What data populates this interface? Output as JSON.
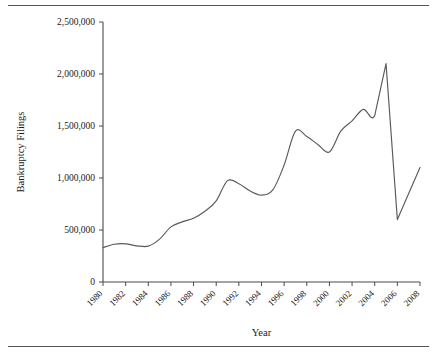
{
  "chart_data": {
    "type": "line",
    "title": "",
    "xlabel": "Year",
    "ylabel": "Bankruptcy Filings",
    "grid": false,
    "legend": "none",
    "xlim": [
      1980,
      2008
    ],
    "ylim": [
      0,
      2500000
    ],
    "x_tick_labels": [
      "1980",
      "1982",
      "1984",
      "1986",
      "1988",
      "1990",
      "1992",
      "1994",
      "1996",
      "1998",
      "2000",
      "2002",
      "2004",
      "2006",
      "2008"
    ],
    "x_tick_values": [
      1980,
      1982,
      1984,
      1986,
      1988,
      1990,
      1992,
      1994,
      1996,
      1998,
      2000,
      2002,
      2004,
      2006,
      2008
    ],
    "y_tick_labels": [
      "0",
      "500,000",
      "1,000,000",
      "1,500,000",
      "2,000,000",
      "2,500,000"
    ],
    "y_tick_values": [
      0,
      500000,
      1000000,
      1500000,
      2000000,
      2500000
    ],
    "x": [
      1980,
      1981,
      1982,
      1983,
      1984,
      1985,
      1986,
      1987,
      1988,
      1989,
      1990,
      1991,
      1992,
      1993,
      1994,
      1995,
      1996,
      1997,
      1998,
      1999,
      2000,
      2001,
      2002,
      2003,
      2004,
      2005,
      2006,
      2007,
      2008
    ],
    "series": [
      {
        "name": "Bankruptcy Filings",
        "color": "#5a5a5a",
        "values": [
          331000,
          363000,
          367000,
          348000,
          345000,
          412000,
          530000,
          578000,
          613000,
          680000,
          780000,
          975000,
          945000,
          875000,
          835000,
          885000,
          1125000,
          1450000,
          1400000,
          1320000,
          1250000,
          1450000,
          1550000,
          1660000,
          1600000,
          2100000,
          600000,
          850000,
          1100000
        ]
      }
    ]
  },
  "axis": {
    "y_title": "Bankruptcy Filings",
    "x_title": "Year"
  }
}
